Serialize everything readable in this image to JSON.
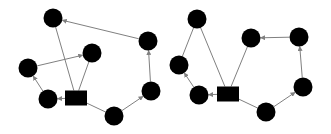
{
  "diagram": {
    "type": "directed-graph-pair",
    "colors": {
      "node": "#000000",
      "edge": "#808080",
      "background": "#ffffff"
    },
    "node_radius": 9.5,
    "graphs": [
      {
        "name": "left-graph",
        "nodes": [
          {
            "id": "L_A",
            "shape": "circle",
            "x": 53,
            "y": 18
          },
          {
            "id": "L_B",
            "shape": "circle",
            "x": 148,
            "y": 41
          },
          {
            "id": "L_C",
            "shape": "circle",
            "x": 92,
            "y": 53
          },
          {
            "id": "L_D",
            "shape": "circle",
            "x": 28,
            "y": 68
          },
          {
            "id": "L_E",
            "shape": "circle",
            "x": 48,
            "y": 99
          },
          {
            "id": "L_R",
            "shape": "rect",
            "x": 76,
            "y": 98,
            "w": 22,
            "h": 15
          },
          {
            "id": "L_F",
            "shape": "circle",
            "x": 114,
            "y": 116
          },
          {
            "id": "L_G",
            "shape": "circle",
            "x": 151,
            "y": 91
          }
        ],
        "edges": [
          {
            "from": "L_A",
            "to": "L_R",
            "arrow": false
          },
          {
            "from": "L_C",
            "to": "L_R",
            "arrow": false
          },
          {
            "from": "L_D",
            "to": "L_C",
            "arrow": true
          },
          {
            "from": "L_E",
            "to": "L_D",
            "arrow": true
          },
          {
            "from": "L_R",
            "to": "L_E",
            "arrow": true
          },
          {
            "from": "L_R",
            "to": "L_F",
            "arrow": false
          },
          {
            "from": "L_F",
            "to": "L_G",
            "arrow": true
          },
          {
            "from": "L_G",
            "to": "L_B",
            "arrow": true
          },
          {
            "from": "L_B",
            "to": "L_A",
            "arrow": true
          }
        ]
      },
      {
        "name": "right-graph",
        "nodes": [
          {
            "id": "R_A",
            "shape": "circle",
            "x": 197,
            "y": 19
          },
          {
            "id": "R_B",
            "shape": "circle",
            "x": 179,
            "y": 65
          },
          {
            "id": "R_C",
            "shape": "circle",
            "x": 199,
            "y": 95
          },
          {
            "id": "R_R",
            "shape": "rect",
            "x": 228,
            "y": 94,
            "w": 22,
            "h": 15
          },
          {
            "id": "R_D",
            "shape": "circle",
            "x": 251,
            "y": 38
          },
          {
            "id": "R_E",
            "shape": "circle",
            "x": 299,
            "y": 37
          },
          {
            "id": "R_F",
            "shape": "circle",
            "x": 303,
            "y": 87
          },
          {
            "id": "R_G",
            "shape": "circle",
            "x": 266,
            "y": 112
          }
        ],
        "edges": [
          {
            "from": "R_A",
            "to": "R_R",
            "arrow": false
          },
          {
            "from": "R_B",
            "to": "R_A",
            "arrow": false
          },
          {
            "from": "R_C",
            "to": "R_B",
            "arrow": true
          },
          {
            "from": "R_R",
            "to": "R_C",
            "arrow": true
          },
          {
            "from": "R_D",
            "to": "R_R",
            "arrow": false
          },
          {
            "from": "R_E",
            "to": "R_D",
            "arrow": true
          },
          {
            "from": "R_F",
            "to": "R_E",
            "arrow": true
          },
          {
            "from": "R_G",
            "to": "R_F",
            "arrow": true
          },
          {
            "from": "R_R",
            "to": "R_G",
            "arrow": false
          }
        ]
      }
    ]
  }
}
